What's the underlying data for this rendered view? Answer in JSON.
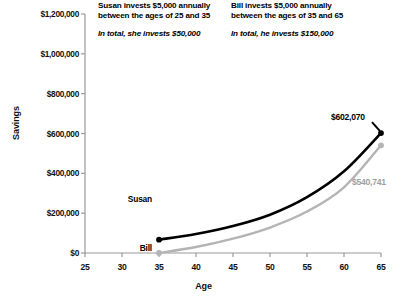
{
  "chart_data": {
    "type": "line",
    "title": "",
    "xlabel": "Age",
    "ylabel": "Savings",
    "xlim": [
      25,
      65
    ],
    "ylim": [
      0,
      1200000
    ],
    "grid": false,
    "legend": "inline-labels",
    "x_ticks": [
      "25",
      "30",
      "35",
      "40",
      "45",
      "50",
      "55",
      "60",
      "65"
    ],
    "x_tick_values": [
      25,
      30,
      35,
      40,
      45,
      50,
      55,
      60,
      65
    ],
    "y_ticks": [
      "$0",
      "$200,000",
      "$400,000",
      "$600,000",
      "$800,000",
      "$1,000,000",
      "$1,200,000"
    ],
    "y_tick_values": [
      0,
      200000,
      400000,
      600000,
      800000,
      1000000,
      1200000
    ],
    "series": [
      {
        "name": "Susan",
        "color": "#000000",
        "x": [
          35,
          40,
          45,
          50,
          55,
          60,
          65
        ],
        "values": [
          67000,
          95000,
          135000,
          192000,
          280000,
          410000,
          602070
        ],
        "end_label": "$602,070",
        "start_marker": true,
        "end_marker": true
      },
      {
        "name": "Bill",
        "color": "#b4b4b4",
        "x": [
          35,
          40,
          45,
          50,
          55,
          60,
          65
        ],
        "values": [
          0,
          30000,
          72000,
          128000,
          208000,
          330000,
          540741
        ],
        "end_label": "$540,741",
        "start_marker": true,
        "end_marker": true
      }
    ],
    "annotations": [
      {
        "id": "susan",
        "headline": "Susan invests $5,000 annually between the ages of 25 and 35",
        "headline_line1": "Susan invests $5,000 annually",
        "headline_line2": "between the ages of 25 and 35",
        "subtext": "In total, she invests $50,000"
      },
      {
        "id": "bill",
        "headline": "Bill invests $5,000 annually between the ages of 35 and 65",
        "headline_line1": "Bill invests $5,000 annually",
        "headline_line2": "between the ages of 35 and 65",
        "subtext": "In total, he invests $150,000"
      }
    ]
  }
}
